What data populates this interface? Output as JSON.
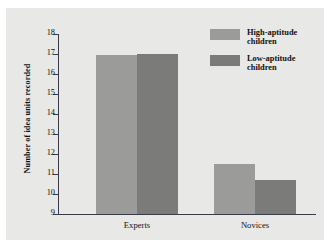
{
  "chart_data": {
    "type": "bar",
    "title": "",
    "xlabel": "",
    "ylabel": "Number of idea units recorded",
    "categories": [
      "Experts",
      "Novices"
    ],
    "series": [
      {
        "name": "High-aptitude children",
        "color": "#9b9b99",
        "values": [
          16.95,
          11.5
        ]
      },
      {
        "name": "Low-aptitude children",
        "color": "#7b7b79",
        "values": [
          17.0,
          10.7
        ]
      }
    ],
    "ylim": [
      9,
      18
    ],
    "yticks": [
      9,
      10,
      11,
      12,
      13,
      14,
      15,
      16,
      17,
      18
    ],
    "ytick_labels": [
      "9",
      "10",
      "11",
      "12",
      "13",
      "14",
      "15",
      "16",
      "17",
      "18"
    ],
    "grid": false,
    "legend_position": "top-right",
    "panel_color": "#e8e8e6",
    "axis_color": "#3a3a4a"
  },
  "legend": {
    "items": [
      {
        "label": "High-aptitude\nchildren",
        "swatch": "light"
      },
      {
        "label": "Low-aptitude\nchildren",
        "swatch": "dark"
      }
    ]
  }
}
